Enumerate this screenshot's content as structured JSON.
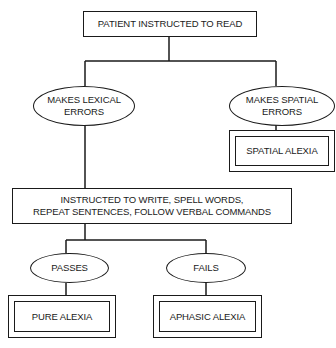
{
  "diagram": {
    "type": "flowchart",
    "nodes": {
      "start": {
        "label": "PATIENT INSTRUCTED TO READ",
        "shape": "rectangle"
      },
      "lexical": {
        "line1": "MAKES LEXICAL",
        "line2": "ERRORS",
        "shape": "ellipse"
      },
      "spatial": {
        "line1": "MAKES SPATIAL",
        "line2": "ERRORS",
        "shape": "ellipse"
      },
      "spatial_result": {
        "label": "SPATIAL ALEXIA",
        "shape": "double-rectangle"
      },
      "instructed": {
        "line1": "INSTRUCTED TO WRITE, SPELL WORDS,",
        "line2": "REPEAT SENTENCES, FOLLOW VERBAL COMMANDS",
        "shape": "rectangle"
      },
      "passes": {
        "label": "PASSES",
        "shape": "ellipse"
      },
      "fails": {
        "label": "FAILS",
        "shape": "ellipse"
      },
      "pure_result": {
        "label": "PURE ALEXIA",
        "shape": "double-rectangle"
      },
      "aphasic_result": {
        "label": "APHASIC ALEXIA",
        "shape": "double-rectangle"
      }
    },
    "edges": [
      {
        "from": "start",
        "to": "lexical"
      },
      {
        "from": "start",
        "to": "spatial"
      },
      {
        "from": "spatial",
        "to": "spatial_result"
      },
      {
        "from": "lexical",
        "to": "instructed"
      },
      {
        "from": "instructed",
        "to": "passes"
      },
      {
        "from": "instructed",
        "to": "fails"
      },
      {
        "from": "passes",
        "to": "pure_result"
      },
      {
        "from": "fails",
        "to": "aphasic_result"
      }
    ]
  }
}
